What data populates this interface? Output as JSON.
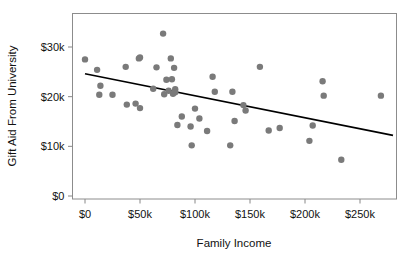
{
  "chart_data": {
    "type": "scatter",
    "title": "",
    "xlabel": "Family Income",
    "ylabel": "Gift Aid From University",
    "xlim": [
      -12000,
      285000
    ],
    "ylim": [
      -1500,
      34500
    ],
    "grid": false,
    "legend": "none",
    "xticks": [
      0,
      50000,
      100000,
      150000,
      200000,
      250000
    ],
    "xtick_labels": [
      "$0",
      "$50k",
      "$100k",
      "$150k",
      "$200k",
      "$250k"
    ],
    "yticks": [
      0,
      10000,
      20000,
      30000
    ],
    "ytick_labels": [
      "$0",
      "$10k",
      "$20k",
      "$30k"
    ],
    "point_color": "#7a7a7a",
    "line_color": "#000000",
    "axis_color": "#888888",
    "point_radius": 3.2,
    "points": [
      {
        "x": 0,
        "y": 27500
      },
      {
        "x": 11000,
        "y": 25400
      },
      {
        "x": 14000,
        "y": 22200
      },
      {
        "x": 13000,
        "y": 20400
      },
      {
        "x": 25000,
        "y": 20400
      },
      {
        "x": 37000,
        "y": 26000
      },
      {
        "x": 38000,
        "y": 18400
      },
      {
        "x": 46000,
        "y": 18600
      },
      {
        "x": 49000,
        "y": 27700
      },
      {
        "x": 50000,
        "y": 27900
      },
      {
        "x": 50000,
        "y": 17700
      },
      {
        "x": 62000,
        "y": 21600
      },
      {
        "x": 65000,
        "y": 25900
      },
      {
        "x": 71000,
        "y": 32700
      },
      {
        "x": 72000,
        "y": 20500
      },
      {
        "x": 74000,
        "y": 23400
      },
      {
        "x": 76000,
        "y": 21200
      },
      {
        "x": 78000,
        "y": 27700
      },
      {
        "x": 79000,
        "y": 23500
      },
      {
        "x": 80000,
        "y": 20600
      },
      {
        "x": 81000,
        "y": 25800
      },
      {
        "x": 82000,
        "y": 21500
      },
      {
        "x": 82000,
        "y": 20900
      },
      {
        "x": 84000,
        "y": 14300
      },
      {
        "x": 88000,
        "y": 16000
      },
      {
        "x": 96000,
        "y": 14000
      },
      {
        "x": 97000,
        "y": 10200
      },
      {
        "x": 100000,
        "y": 17600
      },
      {
        "x": 104000,
        "y": 15600
      },
      {
        "x": 111000,
        "y": 13100
      },
      {
        "x": 116000,
        "y": 24000
      },
      {
        "x": 118000,
        "y": 21000
      },
      {
        "x": 132000,
        "y": 10200
      },
      {
        "x": 134000,
        "y": 21000
      },
      {
        "x": 136000,
        "y": 15100
      },
      {
        "x": 144000,
        "y": 18300
      },
      {
        "x": 146000,
        "y": 17200
      },
      {
        "x": 159000,
        "y": 26000
      },
      {
        "x": 167000,
        "y": 13200
      },
      {
        "x": 177000,
        "y": 13700
      },
      {
        "x": 204000,
        "y": 11100
      },
      {
        "x": 207000,
        "y": 14200
      },
      {
        "x": 216000,
        "y": 23100
      },
      {
        "x": 217000,
        "y": 20200
      },
      {
        "x": 233000,
        "y": 7300
      },
      {
        "x": 269000,
        "y": 20200
      }
    ],
    "trend_line": {
      "x_start": 0,
      "y_start": 24600,
      "x_end": 280000,
      "y_end": 12200
    }
  },
  "axes": {
    "x_title": "Family Income",
    "y_title": "Gift Aid From University"
  }
}
